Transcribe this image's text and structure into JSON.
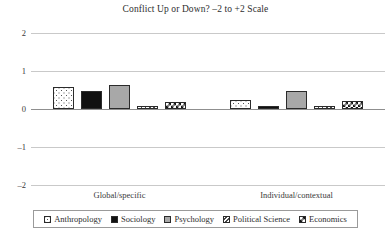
{
  "chart_data": {
    "type": "bar",
    "title": "Conflict Up or Down? –2 to +2 Scale",
    "xlabel": "",
    "ylabel": "",
    "ylim": [
      -2,
      2
    ],
    "yticks": [
      2,
      1,
      0,
      -1,
      -2
    ],
    "ytick_labels": [
      "2",
      "1",
      "0",
      "–1",
      "–2"
    ],
    "grid": true,
    "legend_position": "bottom",
    "categories": [
      "Global/specific",
      "Individual/contextual"
    ],
    "series": [
      {
        "name": "Anthropology",
        "values": [
          0.58,
          0.24
        ],
        "pattern": "dotted",
        "color": "#ffffff"
      },
      {
        "name": "Sociology",
        "values": [
          0.47,
          0.09
        ],
        "pattern": "solid-black",
        "color": "#111111"
      },
      {
        "name": "Psychology",
        "values": [
          0.63,
          0.48
        ],
        "pattern": "solid-gray",
        "color": "#a8a8a8"
      },
      {
        "name": "Political Science",
        "values": [
          0.08,
          0.09
        ],
        "pattern": "diagonal-hatch",
        "color": "#ffffff"
      },
      {
        "name": "Economics",
        "values": [
          0.18,
          0.22
        ],
        "pattern": "checkerboard",
        "color": "#ffffff"
      }
    ]
  },
  "legend": {
    "items": [
      {
        "label": "Anthropology"
      },
      {
        "label": "Sociology"
      },
      {
        "label": "Psychology"
      },
      {
        "label": "Political Science"
      },
      {
        "label": "Economics"
      }
    ]
  }
}
